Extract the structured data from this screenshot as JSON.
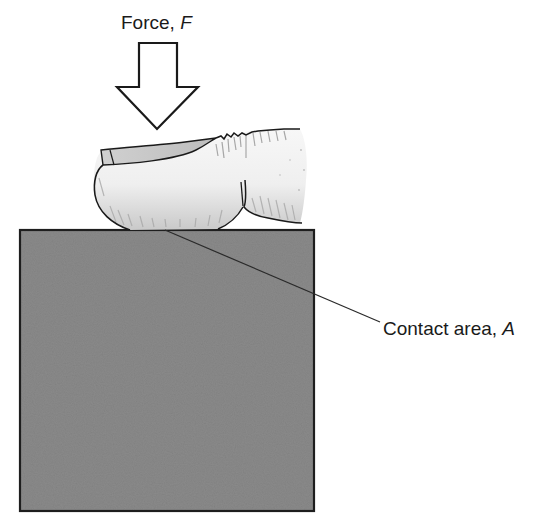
{
  "diagram": {
    "force_label": {
      "text": "Force, ",
      "variable": "F"
    },
    "contact_label": {
      "text": "Contact area, ",
      "variable": "A"
    },
    "colors": {
      "block_fill": "#8a8a8a",
      "block_border": "#1e1e1e",
      "finger_fill": "#f2f2f2",
      "finger_shadow": "#b5b5b5",
      "outline": "#1a1a1a",
      "background": "#ffffff"
    },
    "elements": [
      "force-arrow",
      "finger",
      "block",
      "leader-line"
    ]
  }
}
